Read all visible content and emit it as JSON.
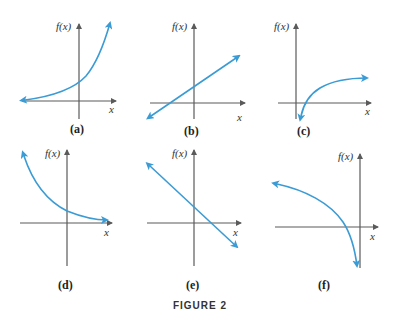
{
  "figure": {
    "caption": "FIGURE 2",
    "curve_color": "#3a9bd5",
    "axis_color": "#5a5a5a",
    "y_axis_label": "f(x)",
    "x_axis_label": "x"
  },
  "panels": [
    {
      "id": "a",
      "label": "(a)",
      "description": "increasing exponential curve"
    },
    {
      "id": "b",
      "label": "(b)",
      "description": "increasing straight line"
    },
    {
      "id": "c",
      "label": "(c)",
      "description": "increasing logarithmic curve"
    },
    {
      "id": "d",
      "label": "(d)",
      "description": "decreasing exponential curve"
    },
    {
      "id": "e",
      "label": "(e)",
      "description": "decreasing straight line"
    },
    {
      "id": "f",
      "label": "(f)",
      "description": "decreasing concave-down curve"
    }
  ]
}
